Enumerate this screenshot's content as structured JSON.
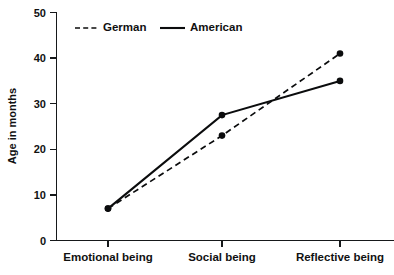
{
  "chart_data": {
    "type": "line",
    "title": "",
    "subtitle": "",
    "xlabel": "",
    "ylabel": "Age in months",
    "categories": [
      "Emotional being",
      "Social being",
      "Reflective being"
    ],
    "series": [
      {
        "name": "German",
        "style": "dashed",
        "color": "#0b0c0d",
        "values": [
          7,
          23,
          41
        ]
      },
      {
        "name": "American",
        "style": "solid",
        "color": "#0b0c0d",
        "values": [
          7,
          27.5,
          35
        ]
      }
    ],
    "ylim": [
      0,
      50
    ],
    "yticks": [
      0,
      10,
      20,
      30,
      40,
      50
    ],
    "ytick_labels": [
      "0",
      "10",
      "20",
      "30",
      "40",
      "50"
    ],
    "grid": false,
    "legend_position": "top-left-inside",
    "markers": "filled-circle"
  },
  "legend": {
    "entries": [
      {
        "label": "German",
        "style": "dashed"
      },
      {
        "label": "American",
        "style": "solid"
      }
    ]
  },
  "axes": {
    "y_title": "Age in months",
    "y_tick_0": "0",
    "y_tick_1": "10",
    "y_tick_2": "20",
    "y_tick_3": "30",
    "y_tick_4": "40",
    "y_tick_5": "50",
    "x_cat_0": "Emotional being",
    "x_cat_1": "Social being",
    "x_cat_2": "Reflective being"
  },
  "colors": {
    "ink": "#0b0c0d",
    "axis": "#16181a",
    "background": "#ffffff"
  }
}
